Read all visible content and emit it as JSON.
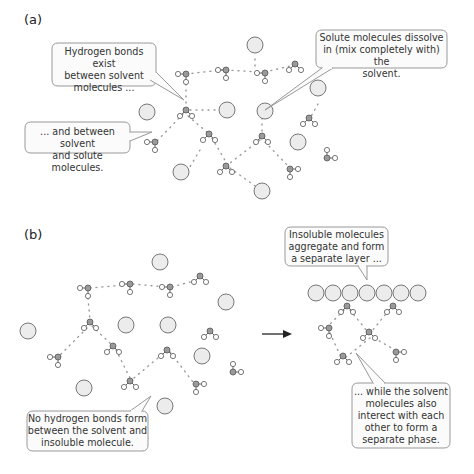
{
  "panels": {
    "a": {
      "label": "(a)",
      "callouts": [
        {
          "id": "hbond-solvent",
          "lines": [
            "Hydrogen bonds exist",
            "between solvent",
            "molecules ..."
          ]
        },
        {
          "id": "solute-dissolve",
          "lines": [
            "Solute molecules dissolve",
            "in (mix completely with) the",
            "solvent."
          ]
        },
        {
          "id": "hbond-solvent-solute",
          "lines": [
            "... and between solvent",
            "and solute molecules."
          ]
        }
      ]
    },
    "b": {
      "label": "(b)",
      "callouts": [
        {
          "id": "insoluble-aggregate",
          "lines": [
            "Insoluble molecules",
            "aggregate and form",
            "a separate layer ..."
          ]
        },
        {
          "id": "no-hbond",
          "lines": [
            "No hydrogen bonds form",
            "between the solvent and",
            "insoluble molecule."
          ]
        },
        {
          "id": "solvent-phase",
          "lines": [
            "... while the solvent",
            "molecules also",
            "interect with each",
            "other to form a",
            "separate phase."
          ]
        }
      ],
      "arrow": "right-arrow"
    }
  },
  "legend": {
    "solute_molecule": "large-grey-circle",
    "solvent_molecule": "water-molecule-icon",
    "hydrogen_bond": "dotted-line"
  },
  "colors": {
    "circle_fill": "#ececec",
    "circle_stroke": "#777777",
    "oxygen_fill": "#9a9a9a",
    "hydrogen_fill": "#ffffff",
    "bond_dots": "#9a9a9a",
    "bubble_fill": "#fbfbfb",
    "bubble_stroke": "#999999"
  }
}
